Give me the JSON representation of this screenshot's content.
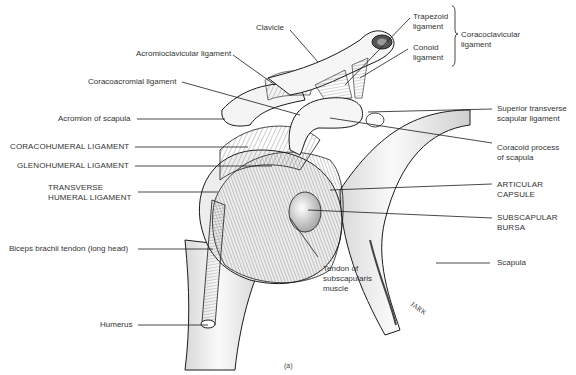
{
  "figure": {
    "caption": "(a)",
    "signature": "JARK"
  },
  "labels": {
    "clavicle": "Clavicle",
    "acromioclavicular_ligament": "Acromioclavicular ligament",
    "coracoacromial_ligament": "Coracoacromial ligament",
    "acromion": "Acromion of scapula",
    "coracohumeral": "CORACOHUMERAL LIGAMENT",
    "glenohumeral": "GLENOHUMERAL LIGAMENT",
    "transverse_humeral": [
      "TRANSVERSE",
      "HUMERAL LIGAMENT"
    ],
    "biceps": "Biceps brachii tendon (long head)",
    "humerus": "Humerus",
    "trapezoid": [
      "Trapezoid",
      "ligament"
    ],
    "conoid": [
      "Conoid",
      "ligament"
    ],
    "coracoclavicular": [
      "Coracoclavicular",
      "ligament"
    ],
    "superior_transverse": [
      "Superior transverse",
      "scapular ligament"
    ],
    "coracoid_process": [
      "Coracoid process",
      "of scapula"
    ],
    "articular_capsule": [
      "ARTICULAR",
      "CAPSULE"
    ],
    "subscapular_bursa": [
      "SUBSCAPULAR",
      "BURSA"
    ],
    "scapula": "Scapula",
    "tendon_subscapularis": [
      "Tendon of",
      "subscapularis",
      "muscle"
    ]
  },
  "colors": {
    "line": "#1a1a1a",
    "bone_fill": "#f2f2f2",
    "shade": "#bdbdbd",
    "text": "#333333"
  }
}
